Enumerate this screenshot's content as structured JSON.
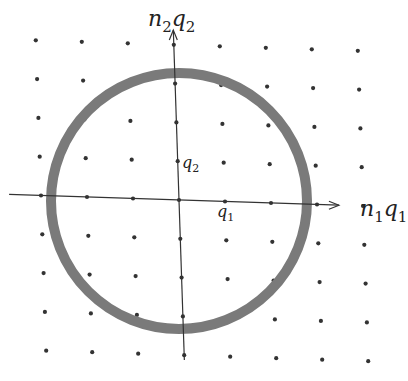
{
  "diagram": {
    "axes": {
      "x_label": {
        "base": "n",
        "sub1": "1",
        "mid": "q",
        "sub2": "1"
      },
      "y_label": {
        "base": "n",
        "sub1": "2",
        "mid": "q",
        "sub2": "2"
      }
    },
    "unit_labels": {
      "q1": {
        "base": "q",
        "sub": "1"
      },
      "q2": {
        "base": "q",
        "sub": "2"
      }
    },
    "lattice": {
      "origin": [
        179,
        200
      ],
      "a1": [
        46,
        1.5
      ],
      "a2": [
        -1.3,
        -38.8
      ],
      "i_range": [
        -3,
        4
      ],
      "j_range": [
        -4,
        4
      ]
    },
    "circle": {
      "cx": 179,
      "cy": 201,
      "r": 128,
      "stroke": "#7a7a7a",
      "stroke_width": 10
    },
    "colors": {
      "axis": "#333333",
      "dot": "#333333"
    }
  }
}
